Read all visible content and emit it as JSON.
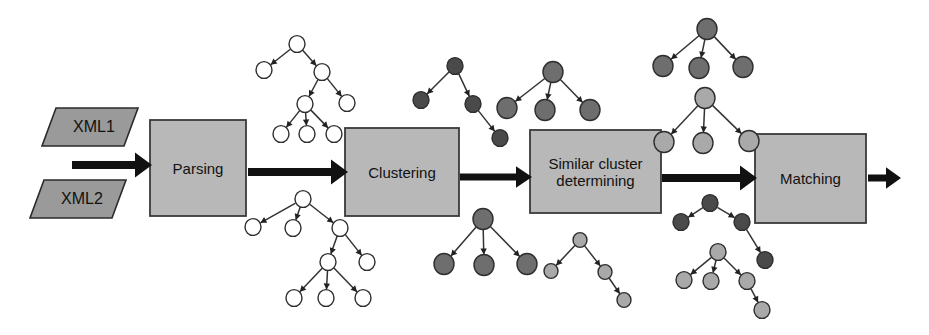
{
  "figure": {
    "background": "#ffffff",
    "type": "process-pipeline-diagram"
  },
  "inputs": [
    {
      "id": "xml1",
      "label": "XML1",
      "shape": "parallelogram",
      "x": 42,
      "y": 108,
      "w": 82,
      "h": 38,
      "skew": 14,
      "fill": "#9a9a9a",
      "stroke": "#2b2b2b"
    },
    {
      "id": "xml2",
      "label": "XML2",
      "shape": "parallelogram",
      "x": 30,
      "y": 180,
      "w": 82,
      "h": 38,
      "skew": 14,
      "fill": "#9a9a9a",
      "stroke": "#2b2b2b"
    }
  ],
  "stages": [
    {
      "id": "parsing",
      "label": "Parsing",
      "x": 150,
      "y": 120,
      "w": 96,
      "h": 96,
      "fill": "#b8b8b8",
      "stroke": "#3a3a3a"
    },
    {
      "id": "clustering",
      "label": "Clustering",
      "x": 345,
      "y": 128,
      "w": 114,
      "h": 88,
      "fill": "#b8b8b8",
      "stroke": "#3a3a3a"
    },
    {
      "id": "similar",
      "label": "Similar cluster\ndetermining",
      "x": 530,
      "y": 130,
      "w": 131,
      "h": 83,
      "fill": "#b8b8b8",
      "stroke": "#3a3a3a"
    },
    {
      "id": "matching",
      "label": "Matching",
      "x": 755,
      "y": 134,
      "w": 111,
      "h": 89,
      "fill": "#b8b8b8",
      "stroke": "#3a3a3a"
    }
  ],
  "arrows": [
    {
      "id": "input-to-parsing",
      "x1": 72,
      "y1": 165,
      "x2": 152,
      "y2": 165,
      "width": 8,
      "head": 17
    },
    {
      "id": "parsing-to-clustering",
      "x1": 248,
      "y1": 172,
      "x2": 348,
      "y2": 172,
      "width": 8,
      "head": 17
    },
    {
      "id": "clustering-to-similar",
      "x1": 460,
      "y1": 177,
      "x2": 532,
      "y2": 177,
      "width": 7,
      "head": 16
    },
    {
      "id": "similar-to-matching",
      "x1": 662,
      "y1": 178,
      "x2": 757,
      "y2": 178,
      "width": 8,
      "head": 17
    },
    {
      "id": "matching-to-output",
      "x1": 868,
      "y1": 178,
      "x2": 901,
      "y2": 178,
      "width": 7,
      "head": 15
    }
  ],
  "node_colors": {
    "empty": "#ffffff",
    "dark": "#6e6e6e",
    "darker": "#4a4a4a",
    "light": "#a9a9a9",
    "stroke": "#2e2e2e"
  },
  "trees": [
    {
      "id": "parsed-tree-top-left",
      "style": "empty",
      "nodes": [
        {
          "id": "a",
          "x": 297,
          "y": 44,
          "r": 8
        },
        {
          "id": "b",
          "x": 264,
          "y": 70,
          "r": 8
        },
        {
          "id": "c",
          "x": 322,
          "y": 72,
          "r": 8
        },
        {
          "id": "d",
          "x": 347,
          "y": 103,
          "r": 8
        },
        {
          "id": "e",
          "x": 305,
          "y": 104,
          "r": 8
        },
        {
          "id": "f",
          "x": 281,
          "y": 134,
          "r": 8
        },
        {
          "id": "g",
          "x": 307,
          "y": 134,
          "r": 8
        },
        {
          "id": "h",
          "x": 334,
          "y": 134,
          "r": 8
        }
      ],
      "edges": [
        [
          "a",
          "b"
        ],
        [
          "a",
          "c"
        ],
        [
          "c",
          "d"
        ],
        [
          "c",
          "e"
        ],
        [
          "e",
          "f"
        ],
        [
          "e",
          "g"
        ],
        [
          "e",
          "h"
        ]
      ]
    },
    {
      "id": "parsed-tree-bottom-left",
      "style": "empty",
      "nodes": [
        {
          "id": "a",
          "x": 303,
          "y": 199,
          "r": 8
        },
        {
          "id": "b",
          "x": 253,
          "y": 227,
          "r": 8
        },
        {
          "id": "c",
          "x": 293,
          "y": 228,
          "r": 8
        },
        {
          "id": "d",
          "x": 340,
          "y": 228,
          "r": 8
        },
        {
          "id": "e",
          "x": 367,
          "y": 262,
          "r": 8
        },
        {
          "id": "f",
          "x": 328,
          "y": 262,
          "r": 8
        },
        {
          "id": "g",
          "x": 294,
          "y": 298,
          "r": 8
        },
        {
          "id": "h",
          "x": 326,
          "y": 298,
          "r": 8
        },
        {
          "id": "i",
          "x": 363,
          "y": 298,
          "r": 8
        }
      ],
      "edges": [
        [
          "a",
          "b"
        ],
        [
          "a",
          "c"
        ],
        [
          "a",
          "d"
        ],
        [
          "d",
          "e"
        ],
        [
          "d",
          "f"
        ],
        [
          "f",
          "g"
        ],
        [
          "f",
          "h"
        ],
        [
          "f",
          "i"
        ]
      ]
    },
    {
      "id": "cluster-tree-top-a",
      "style": "darker",
      "nodes": [
        {
          "id": "a",
          "x": 455,
          "y": 66,
          "r": 8
        },
        {
          "id": "b",
          "x": 421,
          "y": 100,
          "r": 8
        },
        {
          "id": "c",
          "x": 473,
          "y": 104,
          "r": 8
        },
        {
          "id": "d",
          "x": 500,
          "y": 138,
          "r": 8
        }
      ],
      "edges": [
        [
          "a",
          "b"
        ],
        [
          "a",
          "c"
        ],
        [
          "c",
          "d"
        ]
      ]
    },
    {
      "id": "cluster-tree-top-b",
      "style": "dark",
      "nodes": [
        {
          "id": "a",
          "x": 553,
          "y": 72,
          "r": 10
        },
        {
          "id": "b",
          "x": 507,
          "y": 108,
          "r": 10
        },
        {
          "id": "c",
          "x": 545,
          "y": 110,
          "r": 10
        },
        {
          "id": "d",
          "x": 590,
          "y": 110,
          "r": 10
        }
      ],
      "edges": [
        [
          "a",
          "b"
        ],
        [
          "a",
          "c"
        ],
        [
          "a",
          "d"
        ]
      ]
    },
    {
      "id": "similar-tree-top-dark",
      "style": "dark",
      "nodes": [
        {
          "id": "a",
          "x": 707,
          "y": 29,
          "r": 10
        },
        {
          "id": "b",
          "x": 663,
          "y": 66,
          "r": 10
        },
        {
          "id": "c",
          "x": 699,
          "y": 68,
          "r": 10
        },
        {
          "id": "d",
          "x": 743,
          "y": 67,
          "r": 10
        }
      ],
      "edges": [
        [
          "a",
          "b"
        ],
        [
          "a",
          "c"
        ],
        [
          "a",
          "d"
        ]
      ]
    },
    {
      "id": "similar-tree-top-light",
      "style": "light",
      "nodes": [
        {
          "id": "a",
          "x": 705,
          "y": 98,
          "r": 10
        },
        {
          "id": "b",
          "x": 664,
          "y": 142,
          "r": 10
        },
        {
          "id": "c",
          "x": 703,
          "y": 143,
          "r": 10
        },
        {
          "id": "d",
          "x": 749,
          "y": 141,
          "r": 10
        }
      ],
      "edges": [
        [
          "a",
          "b"
        ],
        [
          "a",
          "c"
        ],
        [
          "a",
          "d"
        ]
      ]
    },
    {
      "id": "cluster-tree-bottom-dark",
      "style": "dark",
      "nodes": [
        {
          "id": "a",
          "x": 483,
          "y": 219,
          "r": 10
        },
        {
          "id": "b",
          "x": 444,
          "y": 264,
          "r": 10
        },
        {
          "id": "c",
          "x": 484,
          "y": 265,
          "r": 10
        },
        {
          "id": "d",
          "x": 527,
          "y": 264,
          "r": 10
        }
      ],
      "edges": [
        [
          "a",
          "b"
        ],
        [
          "a",
          "c"
        ],
        [
          "a",
          "d"
        ]
      ]
    },
    {
      "id": "cluster-tree-bottom-light",
      "style": "light",
      "nodes": [
        {
          "id": "a",
          "x": 580,
          "y": 240,
          "r": 7
        },
        {
          "id": "b",
          "x": 551,
          "y": 271,
          "r": 7
        },
        {
          "id": "c",
          "x": 605,
          "y": 272,
          "r": 7
        },
        {
          "id": "d",
          "x": 624,
          "y": 300,
          "r": 7
        }
      ],
      "edges": [
        [
          "a",
          "b"
        ],
        [
          "a",
          "c"
        ],
        [
          "c",
          "d"
        ]
      ]
    },
    {
      "id": "match-tree-dark",
      "style": "darker",
      "nodes": [
        {
          "id": "a",
          "x": 710,
          "y": 203,
          "r": 8
        },
        {
          "id": "b",
          "x": 681,
          "y": 222,
          "r": 8
        },
        {
          "id": "c",
          "x": 742,
          "y": 222,
          "r": 8
        },
        {
          "id": "d",
          "x": 765,
          "y": 260,
          "r": 8
        }
      ],
      "edges": [
        [
          "a",
          "b"
        ],
        [
          "a",
          "c"
        ],
        [
          "c",
          "d"
        ]
      ]
    },
    {
      "id": "match-tree-light",
      "style": "light",
      "nodes": [
        {
          "id": "a",
          "x": 718,
          "y": 252,
          "r": 8
        },
        {
          "id": "b",
          "x": 684,
          "y": 280,
          "r": 8
        },
        {
          "id": "c",
          "x": 711,
          "y": 281,
          "r": 8
        },
        {
          "id": "d",
          "x": 747,
          "y": 281,
          "r": 8
        },
        {
          "id": "e",
          "x": 762,
          "y": 310,
          "r": 8
        }
      ],
      "edges": [
        [
          "a",
          "b"
        ],
        [
          "a",
          "c"
        ],
        [
          "a",
          "d"
        ],
        [
          "d",
          "e"
        ]
      ]
    }
  ]
}
